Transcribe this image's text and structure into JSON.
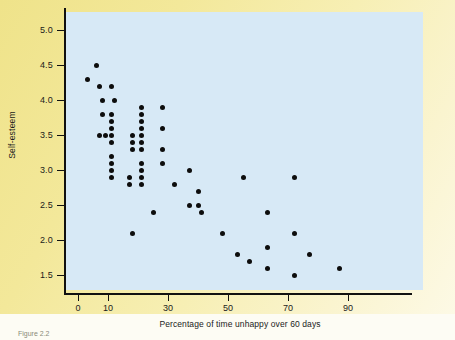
{
  "figure": {
    "background_color": "#f1e58e",
    "panel_color": "#d7e9f6",
    "axis_color": "#111111",
    "dot_color": "#0d0d0d",
    "caption": "Figure 2.2"
  },
  "chart_data": {
    "type": "scatter",
    "title": "",
    "xlabel": "Percentage of time unhappy over 60 days",
    "ylabel": "Self-esteem",
    "xlim": [
      0,
      100
    ],
    "ylim": [
      1.2,
      5.2
    ],
    "grid": false,
    "legend": null,
    "xticks": [
      0,
      10,
      30,
      50,
      70,
      90
    ],
    "xtick_labels": [
      "0",
      "10",
      "30",
      "50",
      "70",
      "90"
    ],
    "yticks": [
      1.5,
      2.0,
      2.5,
      3.0,
      3.5,
      4.0,
      4.5,
      5.0
    ],
    "ytick_labels": [
      "1.5",
      "2.0",
      "2.5",
      "3.0",
      "3.5",
      "4.0",
      "4.5",
      "5.0"
    ],
    "points": [
      {
        "x": 3,
        "y": 4.3
      },
      {
        "x": 6,
        "y": 4.5
      },
      {
        "x": 7,
        "y": 4.2
      },
      {
        "x": 8,
        "y": 4.0
      },
      {
        "x": 8,
        "y": 3.8
      },
      {
        "x": 7,
        "y": 3.5
      },
      {
        "x": 9,
        "y": 3.5
      },
      {
        "x": 11,
        "y": 4.2
      },
      {
        "x": 12,
        "y": 4.0
      },
      {
        "x": 11,
        "y": 3.8
      },
      {
        "x": 11,
        "y": 3.7
      },
      {
        "x": 11,
        "y": 3.6
      },
      {
        "x": 11,
        "y": 3.5
      },
      {
        "x": 11,
        "y": 3.4
      },
      {
        "x": 11,
        "y": 3.2
      },
      {
        "x": 11,
        "y": 3.1
      },
      {
        "x": 11,
        "y": 3.0
      },
      {
        "x": 11,
        "y": 2.9
      },
      {
        "x": 18,
        "y": 3.5
      },
      {
        "x": 18,
        "y": 3.4
      },
      {
        "x": 18,
        "y": 3.3
      },
      {
        "x": 17,
        "y": 2.9
      },
      {
        "x": 17,
        "y": 2.8
      },
      {
        "x": 21,
        "y": 3.9
      },
      {
        "x": 21,
        "y": 3.8
      },
      {
        "x": 21,
        "y": 3.7
      },
      {
        "x": 21,
        "y": 3.6
      },
      {
        "x": 21,
        "y": 3.5
      },
      {
        "x": 21,
        "y": 3.4
      },
      {
        "x": 21,
        "y": 3.3
      },
      {
        "x": 21,
        "y": 3.1
      },
      {
        "x": 21,
        "y": 3.0
      },
      {
        "x": 21,
        "y": 2.9
      },
      {
        "x": 21,
        "y": 2.8
      },
      {
        "x": 28,
        "y": 3.9
      },
      {
        "x": 28,
        "y": 3.6
      },
      {
        "x": 28,
        "y": 3.3
      },
      {
        "x": 28,
        "y": 3.1
      },
      {
        "x": 18,
        "y": 2.1
      },
      {
        "x": 25,
        "y": 2.4
      },
      {
        "x": 32,
        "y": 2.8
      },
      {
        "x": 37,
        "y": 3.0
      },
      {
        "x": 37,
        "y": 2.5
      },
      {
        "x": 40,
        "y": 2.7
      },
      {
        "x": 40,
        "y": 2.5
      },
      {
        "x": 41,
        "y": 2.4
      },
      {
        "x": 48,
        "y": 2.1
      },
      {
        "x": 53,
        "y": 1.8
      },
      {
        "x": 55,
        "y": 2.9
      },
      {
        "x": 57,
        "y": 1.7
      },
      {
        "x": 63,
        "y": 2.4
      },
      {
        "x": 63,
        "y": 1.9
      },
      {
        "x": 63,
        "y": 1.6
      },
      {
        "x": 72,
        "y": 2.9
      },
      {
        "x": 72,
        "y": 2.1
      },
      {
        "x": 72,
        "y": 1.5
      },
      {
        "x": 77,
        "y": 1.8
      },
      {
        "x": 87,
        "y": 1.6
      }
    ]
  }
}
